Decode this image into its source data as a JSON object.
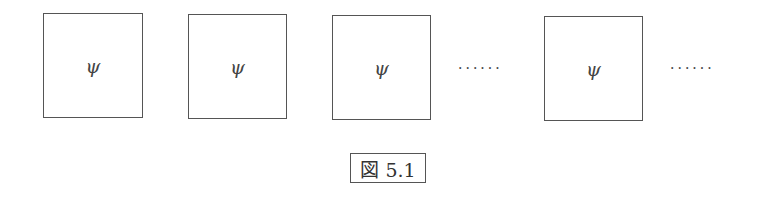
{
  "diagram": {
    "boxes": [
      {
        "label": "ψ"
      },
      {
        "label": "ψ"
      },
      {
        "label": "ψ"
      },
      {
        "label": "ψ"
      }
    ],
    "ellipses": [
      "······",
      "······"
    ],
    "caption": "図 5.1"
  }
}
